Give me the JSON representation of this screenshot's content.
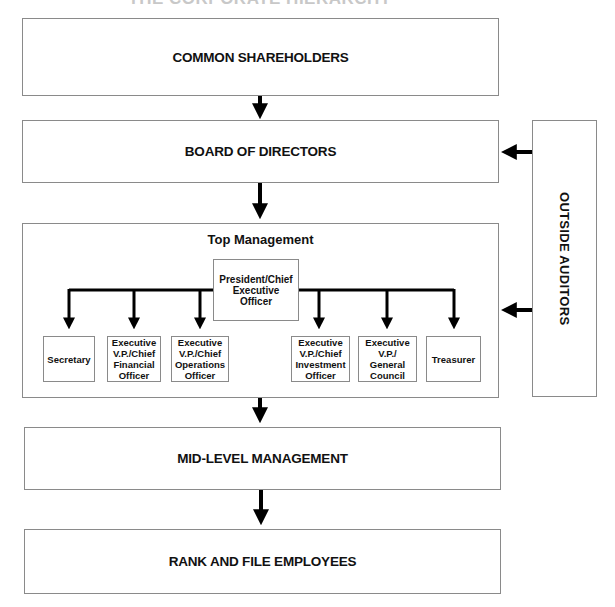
{
  "title": "THE CORPORATE HIERARCHY",
  "levels": {
    "shareholders": "COMMON SHAREHOLDERS",
    "board": "BOARD OF DIRECTORS",
    "top_management": "Top Management",
    "mid_level": "MID-LEVEL MANAGEMENT",
    "rank_and_file": "RANK AND FILE EMPLOYEES"
  },
  "outside_auditors": "OUTSIDE AUDITORS",
  "ceo": "President/Chief Executive Officer",
  "officers": [
    {
      "label": "Secretary"
    },
    {
      "label": "Executive V.P./Chief Financial Officer"
    },
    {
      "label": "Executive V.P./Chief Operations Officer"
    },
    {
      "label": "Executive V.P./Chief Investment Officer"
    },
    {
      "label": "Executive V.P./ General Council"
    },
    {
      "label": "Treasurer"
    }
  ],
  "colors": {
    "border": "#8a8a8a",
    "arrow": "#000000",
    "text": "#111111"
  }
}
